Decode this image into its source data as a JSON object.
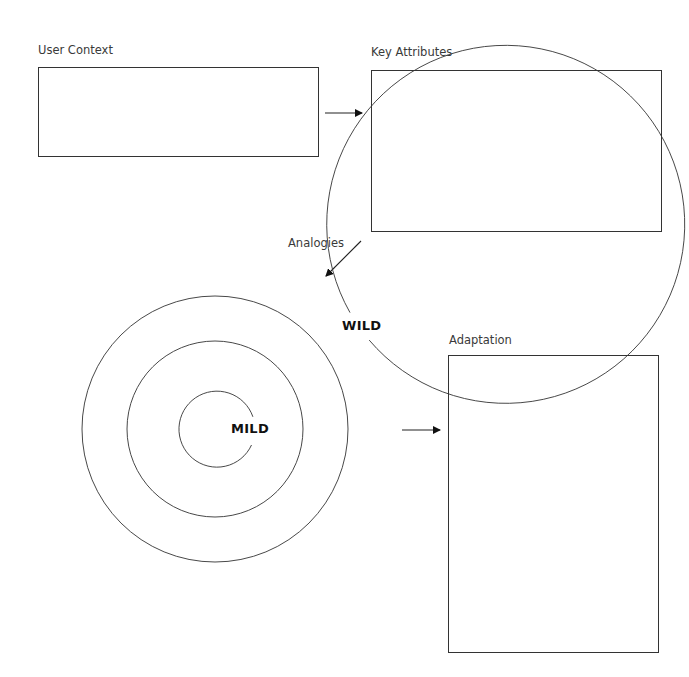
{
  "diagram": {
    "nodes": [
      {
        "id": "user_context",
        "label": "User Context"
      },
      {
        "id": "key_attributes",
        "label": "Key Attributes"
      },
      {
        "id": "adaptation",
        "label": "Adaptation"
      }
    ],
    "edges": [
      {
        "from": "user_context",
        "to": "key_attributes"
      },
      {
        "from": "key_attributes",
        "to": "analogies_target",
        "label": "Analogies"
      },
      {
        "from": "analogies_target",
        "to": "adaptation"
      }
    ],
    "target": {
      "rings": 4,
      "outer_label": "WILD",
      "inner_label": "MILD"
    }
  },
  "colors": {
    "line": "#333333",
    "text": "#3a3a3a",
    "background": "#ffffff"
  }
}
